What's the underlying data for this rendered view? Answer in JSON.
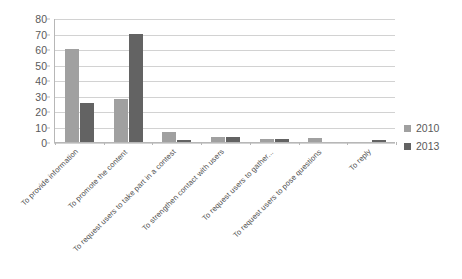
{
  "chart_data": {
    "type": "bar",
    "title": "",
    "xlabel": "",
    "ylabel": "",
    "ylim": [
      0,
      80
    ],
    "yticks": [
      0,
      10,
      20,
      30,
      40,
      50,
      60,
      70,
      80
    ],
    "grid": true,
    "legend_position": "right",
    "categories": [
      "To provide information",
      "To promote the content",
      "To request users to take part in a contest",
      "To strengthen contact with users",
      "To request users to gather...",
      "To request users to pose questions",
      "To reply"
    ],
    "series": [
      {
        "name": "2010",
        "color": "#a0a0a0",
        "values": [
          60,
          28,
          6.5,
          3,
          2,
          2.5,
          0
        ]
      },
      {
        "name": "2013",
        "color": "#636363",
        "values": [
          25,
          70,
          1,
          3,
          2,
          0,
          1
        ]
      }
    ]
  },
  "legend": {
    "items": [
      {
        "label": "2010",
        "color": "#a0a0a0"
      },
      {
        "label": "2013",
        "color": "#636363"
      }
    ]
  },
  "colors": {
    "series_2010": "#a0a0a0",
    "series_2013": "#636363",
    "gridline": "#d2d2d2",
    "axis": "#b7b7b7",
    "text": "#5a5a5a",
    "background": "#ffffff"
  }
}
